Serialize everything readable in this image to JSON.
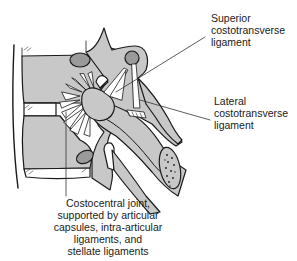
{
  "figure": {
    "type": "anatomical-illustration",
    "colors": {
      "bone_fill": "#c8c8c8",
      "cartilage_fill": "#9a9a9a",
      "ligament_fill": "#ffffff",
      "outline": "#1a1a1a",
      "leader_line": "#333333"
    }
  },
  "labels": {
    "superior_costotransverse": "Superior\ncostotransverse\nligament",
    "lateral_costotransverse": "Lateral\ncostotransverse\nligament",
    "costocentral": "Costocentral joint,\nsupported by articular\ncapsules, intra-articular\nligaments, and\nstellate ligaments"
  }
}
